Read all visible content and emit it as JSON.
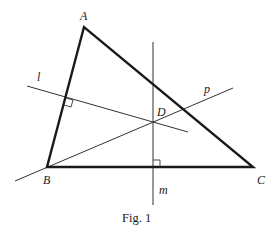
{
  "figure": {
    "caption": "Fig. 1",
    "points": {
      "A": {
        "label": "A",
        "x": 84,
        "y": 27
      },
      "B": {
        "label": "B",
        "x": 47,
        "y": 167
      },
      "C": {
        "label": "C",
        "x": 253,
        "y": 167
      },
      "D": {
        "label": "D",
        "x": 153,
        "y": 122
      }
    },
    "lines": {
      "l": {
        "label": "l"
      },
      "m": {
        "label": "m"
      },
      "p": {
        "label": "p"
      }
    },
    "colors": {
      "stroke": "#1a1a1a",
      "thin_stroke": "#333333",
      "background": "#ffffff"
    }
  }
}
